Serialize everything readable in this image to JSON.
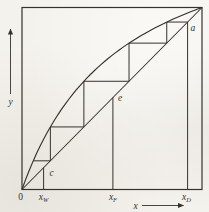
{
  "figure": {
    "axis": {
      "x_label": "x",
      "y_label": "y"
    },
    "labels": {
      "origin": "0",
      "point_a": "a",
      "point_c": "c",
      "point_e": "e",
      "x_w": {
        "base": "x",
        "sub": "W"
      },
      "x_f": {
        "base": "x",
        "sub": "F"
      },
      "x_d": {
        "base": "x",
        "sub": "D"
      }
    },
    "geometry": {
      "type": "mccabe-thiele-stage-construction",
      "alpha": 2.8,
      "x_w": 0.12,
      "x_f": 0.505,
      "x_d": 0.92,
      "steps": 5,
      "x_range": [
        0,
        1
      ],
      "y_range": [
        0,
        1
      ],
      "diagonal": "y = x",
      "equilibrium_curve": "y = alpha*x / (1 + (alpha-1)*x)"
    },
    "colors": {
      "ink": "#35322b",
      "paper": "#f4f2ec"
    }
  }
}
